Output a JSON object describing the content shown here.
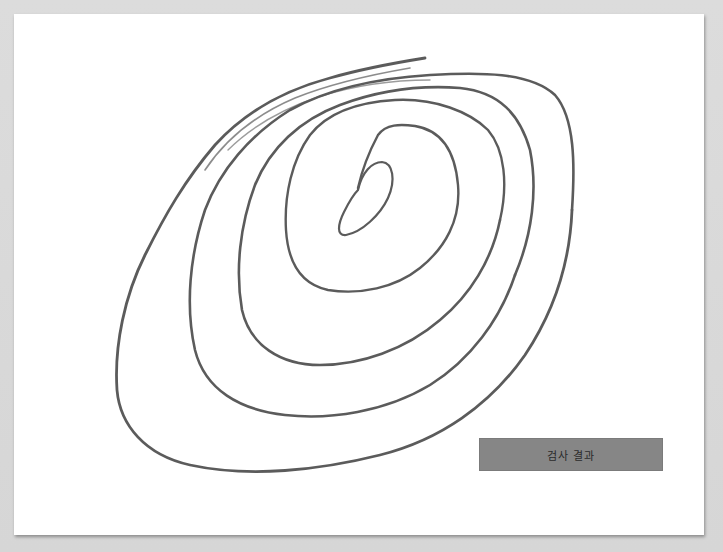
{
  "drawing": {
    "type": "spiral-drawing",
    "stroke_color": "#4a4a4a"
  },
  "actions": {
    "result_button_label": "검사 결과",
    "result_button_color": "#868686"
  }
}
